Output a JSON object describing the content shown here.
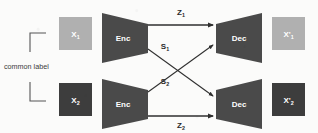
{
  "figure": {
    "background_color": "#fbfbfa"
  },
  "colors": {
    "light_box": "#b0b0b0",
    "dark_box": "#3d3d3d",
    "trapezoid": "#4a4a4a",
    "arrow": "#2f2f2f",
    "bracket": "#555555",
    "box_text": "#ffffff",
    "edge_text": "#2a2a2a"
  },
  "bracket": {
    "label": "common label",
    "name": "common-label-bracket"
  },
  "branches": [
    {
      "id": "top",
      "input": {
        "label": "X",
        "subscript": "1",
        "style": "light"
      },
      "encoder": {
        "label": "Enc"
      },
      "decoder": {
        "label": "Dec"
      },
      "output": {
        "label": "X'",
        "subscript": "1",
        "style": "light"
      },
      "direct_edge": {
        "label": "Z",
        "subscript": "1"
      },
      "cross_edge": {
        "label": "S",
        "subscript": "1"
      }
    },
    {
      "id": "bottom",
      "input": {
        "label": "X",
        "subscript": "2",
        "style": "dark"
      },
      "encoder": {
        "label": "Enc"
      },
      "decoder": {
        "label": "Dec"
      },
      "output": {
        "label": "X'",
        "subscript": "2",
        "style": "dark"
      },
      "direct_edge": {
        "label": "Z",
        "subscript": "2"
      },
      "cross_edge": {
        "label": "S",
        "subscript": "2"
      }
    }
  ],
  "edges": {
    "z1": {
      "label": "Z",
      "subscript": "1",
      "from": "top-encoder",
      "to": "top-decoder"
    },
    "z2": {
      "label": "Z",
      "subscript": "2",
      "from": "bottom-encoder",
      "to": "bottom-decoder"
    },
    "s1": {
      "label": "S",
      "subscript": "1",
      "from": "top-encoder",
      "to": "bottom-decoder"
    },
    "s2": {
      "label": "S",
      "subscript": "2",
      "from": "bottom-encoder",
      "to": "top-decoder"
    }
  }
}
